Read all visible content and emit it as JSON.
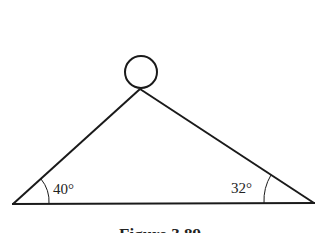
{
  "figure": {
    "caption": "Figure 3.89",
    "angles": {
      "left": {
        "label": "40°",
        "value": 40
      },
      "right": {
        "label": "32°",
        "value": 32
      }
    },
    "shapes": {
      "circle": {
        "cx": 141,
        "cy": 72,
        "r": 16
      },
      "apex": [
        140,
        89
      ],
      "left_corner": [
        13,
        204
      ],
      "right_corner": [
        314,
        203
      ]
    },
    "colors": {
      "stroke": "#1a1a1a",
      "background": "#ffffff"
    }
  }
}
